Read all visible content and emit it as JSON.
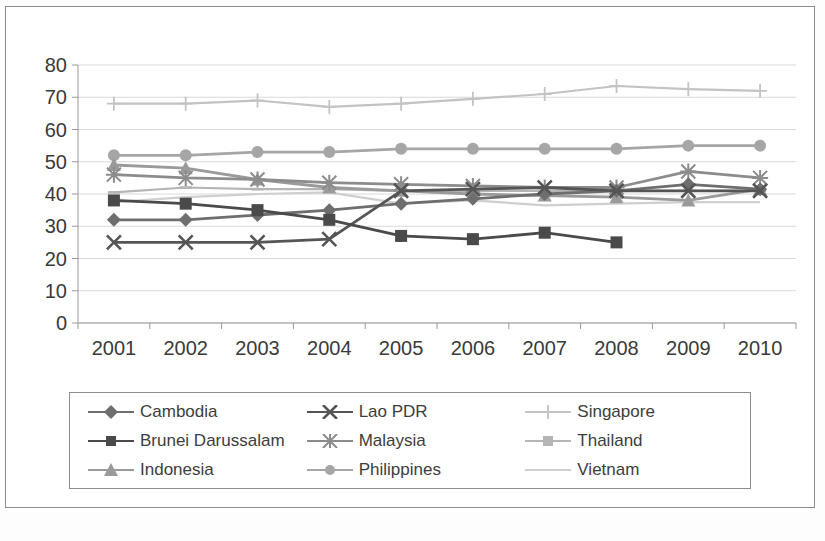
{
  "chart_data": {
    "type": "line",
    "title": "",
    "subtitle": "",
    "xlabel": "",
    "ylabel": "",
    "categories": [
      "2001",
      "2002",
      "2003",
      "2004",
      "2005",
      "2006",
      "2007",
      "2008",
      "2009",
      "2010"
    ],
    "x_tick_labels": [
      "2001",
      "2002",
      "2003",
      "2004",
      "2005",
      "2006",
      "2007",
      "2008",
      "2009",
      "2010"
    ],
    "y_tick_labels": [
      "0",
      "10",
      "20",
      "30",
      "40",
      "50",
      "60",
      "70",
      "80"
    ],
    "ylim": [
      0,
      80
    ],
    "y_tick_step": 10,
    "grid": "horizontal",
    "legend_position": "bottom",
    "legend_columns": 3,
    "series": [
      {
        "name": "Cambodia",
        "marker": "diamond",
        "color": "#6e6e6e",
        "values": [
          32,
          32,
          33.5,
          35,
          37,
          38.5,
          40,
          41,
          43,
          41.5
        ]
      },
      {
        "name": "Brunei Darussalam",
        "marker": "square",
        "color": "#4a4a4a",
        "values": [
          38,
          37,
          35,
          32,
          27,
          26,
          28,
          25,
          null,
          null
        ]
      },
      {
        "name": "Indonesia",
        "marker": "triangle",
        "color": "#9a9a9a",
        "values": [
          49,
          48,
          44.5,
          42,
          41,
          40,
          39.5,
          39,
          38,
          41.5
        ]
      },
      {
        "name": "Lao PDR",
        "marker": "x",
        "color": "#555555",
        "values": [
          25,
          25,
          25,
          26,
          41,
          41.5,
          42,
          41,
          41,
          41
        ]
      },
      {
        "name": "Malaysia",
        "marker": "star",
        "color": "#8c8c8c",
        "values": [
          46,
          45,
          44.5,
          43.5,
          43,
          42.5,
          42,
          42,
          47,
          45
        ]
      },
      {
        "name": "Philippines",
        "marker": "circle",
        "color": "#a6a6a6",
        "values": [
          52,
          52,
          53,
          53,
          54,
          54,
          54,
          54,
          55,
          55
        ]
      },
      {
        "name": "Singapore",
        "marker": "plus",
        "color": "#c3c3c3",
        "values": [
          68,
          68,
          69,
          67,
          68,
          69.5,
          71,
          73.5,
          72.5,
          72
        ]
      },
      {
        "name": "Thailand",
        "marker": "dash",
        "color": "#b5b5b5",
        "values": [
          40.5,
          42,
          41.5,
          41.5,
          41,
          41,
          41,
          41,
          41,
          41
        ]
      },
      {
        "name": "Vietnam",
        "marker": "none",
        "color": "#cfcfcf",
        "values": [
          37.5,
          39,
          40,
          40.5,
          37,
          38,
          36.5,
          37,
          37.5,
          37.5
        ]
      }
    ]
  },
  "legend": {
    "items": [
      {
        "label": "Cambodia"
      },
      {
        "label": "Brunei Darussalam"
      },
      {
        "label": "Indonesia"
      },
      {
        "label": "Lao PDR"
      },
      {
        "label": "Malaysia"
      },
      {
        "label": "Philippines"
      },
      {
        "label": "Singapore"
      },
      {
        "label": "Thailand"
      },
      {
        "label": "Vietnam"
      }
    ]
  },
  "axes": {
    "y_labels": [
      "80",
      "70",
      "60",
      "50",
      "40",
      "30",
      "20",
      "10",
      "0"
    ],
    "x_labels": [
      "2001",
      "2002",
      "2003",
      "2004",
      "2005",
      "2006",
      "2007",
      "2008",
      "2009",
      "2010"
    ]
  }
}
